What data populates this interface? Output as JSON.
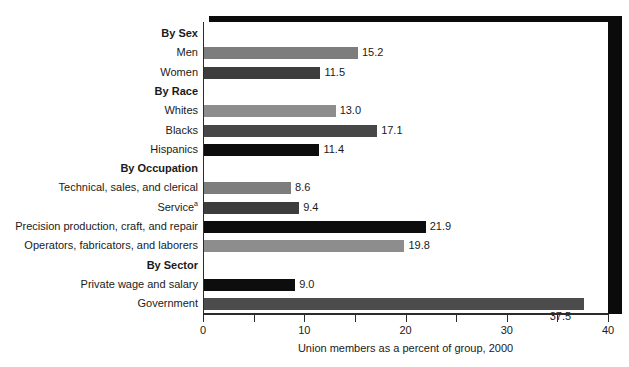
{
  "top_edge_remnant": "",
  "chart_data": {
    "type": "bar",
    "orientation": "horizontal",
    "title": "",
    "xlabel": "Union members as a percent of group, 2000",
    "ylabel": "",
    "xlim": [
      0,
      40
    ],
    "grid": false,
    "legend": "none",
    "axis": {
      "major_ticks": [
        0,
        10,
        20,
        30,
        40
      ],
      "minor_ticks": [
        5,
        15,
        25,
        35
      ],
      "tick_labels": [
        "0",
        "10",
        "20",
        "30",
        "40"
      ]
    },
    "rows": [
      {
        "label": "By Sex",
        "is_group": true,
        "value": null,
        "color": null
      },
      {
        "label": "Men",
        "is_group": false,
        "value": 15.2,
        "value_label": "15.2",
        "color": "#7d7d7d",
        "label_position": "right"
      },
      {
        "label": "Women",
        "is_group": false,
        "value": 11.5,
        "value_label": "11.5",
        "color": "#3d3d3d",
        "label_position": "right"
      },
      {
        "label": "By Race",
        "is_group": true,
        "value": null,
        "color": null
      },
      {
        "label": "Whites",
        "is_group": false,
        "value": 13.0,
        "value_label": "13.0",
        "color": "#8d8d8d",
        "label_position": "right"
      },
      {
        "label": "Blacks",
        "is_group": false,
        "value": 17.1,
        "value_label": "17.1",
        "color": "#474747",
        "label_position": "right"
      },
      {
        "label": "Hispanics",
        "is_group": false,
        "value": 11.4,
        "value_label": "11.4",
        "color": "#0d0d0d",
        "label_position": "right"
      },
      {
        "label": "By Occupation",
        "is_group": true,
        "value": null,
        "color": null
      },
      {
        "label": "Technical, sales, and clerical",
        "is_group": false,
        "value": 8.6,
        "value_label": "8.6",
        "color": "#7d7d7d",
        "label_position": "right"
      },
      {
        "label": "Service",
        "footnote": "a",
        "is_group": false,
        "value": 9.4,
        "value_label": "9.4",
        "color": "#3d3d3d",
        "label_position": "right"
      },
      {
        "label": "Precision production, craft, and repair",
        "is_group": false,
        "value": 21.9,
        "value_label": "21.9",
        "color": "#0d0d0d",
        "label_position": "right"
      },
      {
        "label": "Operators, fabricators, and laborers",
        "is_group": false,
        "value": 19.8,
        "value_label": "19.8",
        "color": "#8d8d8d",
        "label_position": "right"
      },
      {
        "label": "By Sector",
        "is_group": true,
        "value": null,
        "color": null
      },
      {
        "label": "Private wage and salary",
        "is_group": false,
        "value": 9.0,
        "value_label": "9.0",
        "color": "#0d0d0d",
        "label_position": "right"
      },
      {
        "label": "Government",
        "is_group": false,
        "value": 37.5,
        "value_label": "37.5",
        "color": "#4c4c4c",
        "label_position": "below-right"
      }
    ]
  }
}
